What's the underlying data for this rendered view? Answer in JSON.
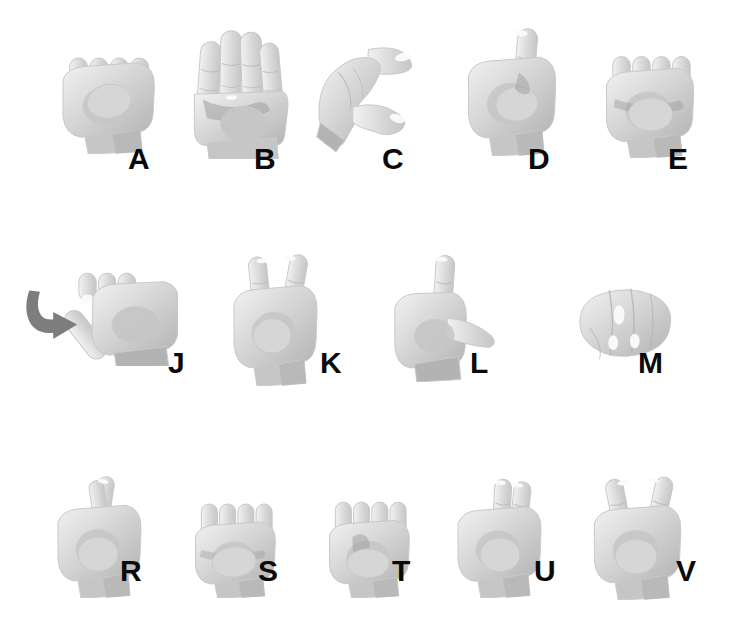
{
  "chart": {
    "background_color": "#ffffff",
    "label_color": "#0a0a0a",
    "hand_colors": {
      "base": "#d6d6d6",
      "mid": "#c6c6c6",
      "shadow": "#b3b3b3",
      "deep_shadow": "#9e9e9e",
      "highlight": "#f2f2f2",
      "nail": "#fbfbfb",
      "outline": "#c9c9c9",
      "arrow": "#7d7d7d"
    },
    "rows": [
      {
        "row_index": 1,
        "top": 28,
        "items": [
          {
            "letter": "A",
            "glyph": "fist-a",
            "hand_left": 52,
            "hand_top": 34,
            "hand_w": 110,
            "hand_h": 120,
            "label_left": 128,
            "label_top": 144
          },
          {
            "letter": "B",
            "glyph": "flat-b",
            "hand_left": 186,
            "hand_top": 24,
            "hand_w": 105,
            "hand_h": 135,
            "label_left": 254,
            "label_top": 144
          },
          {
            "letter": "C",
            "glyph": "curve-c",
            "hand_left": 312,
            "hand_top": 38,
            "hand_w": 120,
            "hand_h": 115,
            "label_left": 382,
            "label_top": 144
          },
          {
            "letter": "D",
            "glyph": "point-d",
            "hand_left": 458,
            "hand_top": 26,
            "hand_w": 105,
            "hand_h": 130,
            "label_left": 528,
            "label_top": 144
          },
          {
            "letter": "E",
            "glyph": "fist-e",
            "hand_left": 596,
            "hand_top": 40,
            "hand_w": 105,
            "hand_h": 118,
            "label_left": 668,
            "label_top": 144
          }
        ]
      },
      {
        "row_index": 2,
        "top": 246,
        "items": [
          {
            "letter": "J",
            "glyph": "hook-j",
            "hand_left": 60,
            "hand_top": 258,
            "hand_w": 118,
            "hand_h": 108,
            "label_left": 168,
            "label_top": 348,
            "motion_arrow": true,
            "arrow_left": 22,
            "arrow_top": 288,
            "arrow_w": 60,
            "arrow_h": 52
          },
          {
            "letter": "K",
            "glyph": "two-up-k",
            "hand_left": 224,
            "hand_top": 254,
            "hand_w": 100,
            "hand_h": 132,
            "label_left": 320,
            "label_top": 348
          },
          {
            "letter": "L",
            "glyph": "angle-l",
            "hand_left": 386,
            "hand_top": 254,
            "hand_w": 110,
            "hand_h": 128,
            "label_left": 470,
            "label_top": 348
          },
          {
            "letter": "M",
            "glyph": "tuck-m",
            "hand_left": 574,
            "hand_top": 282,
            "hand_w": 98,
            "hand_h": 82,
            "label_left": 638,
            "label_top": 348
          }
        ]
      },
      {
        "row_index": 3,
        "top": 470,
        "items": [
          {
            "letter": "R",
            "glyph": "cross-r",
            "hand_left": 48,
            "hand_top": 476,
            "hand_w": 100,
            "hand_h": 122,
            "label_left": 120,
            "label_top": 556
          },
          {
            "letter": "S",
            "glyph": "fist-s",
            "hand_left": 186,
            "hand_top": 498,
            "hand_w": 96,
            "hand_h": 100,
            "label_left": 258,
            "label_top": 556
          },
          {
            "letter": "T",
            "glyph": "fist-t",
            "hand_left": 320,
            "hand_top": 496,
            "hand_w": 96,
            "hand_h": 102,
            "label_left": 392,
            "label_top": 556
          },
          {
            "letter": "U",
            "glyph": "two-up-u",
            "hand_left": 448,
            "hand_top": 478,
            "hand_w": 100,
            "hand_h": 120,
            "label_left": 534,
            "label_top": 556
          },
          {
            "letter": "V",
            "glyph": "two-split-v",
            "hand_left": 584,
            "hand_top": 476,
            "hand_w": 104,
            "hand_h": 124,
            "label_left": 676,
            "label_top": 556
          }
        ]
      }
    ]
  }
}
